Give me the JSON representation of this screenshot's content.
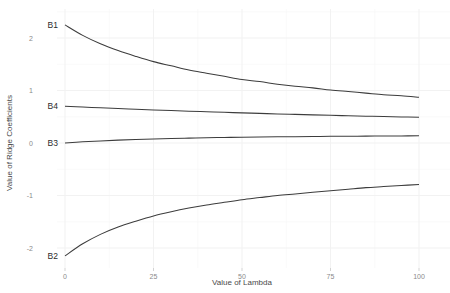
{
  "chart_data": {
    "type": "line",
    "title": "",
    "xlabel": "Value of Lambda",
    "ylabel": "Value of Ridge Coefficients",
    "xlim": [
      0,
      100
    ],
    "ylim": [
      -2.35,
      2.35
    ],
    "xticks": [
      0,
      25,
      50,
      75,
      100
    ],
    "xticklabels": [
      "0",
      "25",
      "50",
      "75",
      "100"
    ],
    "yticks": [
      2,
      1,
      0,
      -1,
      -2
    ],
    "yticklabels": [
      "2",
      "1",
      "0",
      "-1",
      "-2"
    ],
    "grid": true,
    "legend_position": "inline-left-labels",
    "line_color": "#3c3c3c",
    "panel_background": "#ffffff",
    "gridline_color": "#f2f2f2",
    "x": [
      0,
      5,
      10,
      15,
      20,
      25,
      30,
      35,
      40,
      45,
      50,
      55,
      60,
      65,
      70,
      75,
      80,
      85,
      90,
      95,
      100
    ],
    "series": [
      {
        "name": "B1",
        "label": "B1",
        "values": [
          2.25,
          2.05,
          1.89,
          1.76,
          1.65,
          1.55,
          1.47,
          1.39,
          1.33,
          1.27,
          1.21,
          1.17,
          1.12,
          1.08,
          1.05,
          1.01,
          0.98,
          0.95,
          0.92,
          0.9,
          0.87
        ]
      },
      {
        "name": "B4",
        "label": "B4",
        "values": [
          0.7,
          0.685,
          0.67,
          0.656,
          0.643,
          0.63,
          0.618,
          0.606,
          0.595,
          0.584,
          0.574,
          0.564,
          0.554,
          0.545,
          0.536,
          0.527,
          0.519,
          0.511,
          0.503,
          0.496,
          0.489
        ]
      },
      {
        "name": "B3",
        "label": "B3",
        "values": [
          0.0,
          0.022,
          0.04,
          0.055,
          0.067,
          0.077,
          0.086,
          0.093,
          0.1,
          0.105,
          0.11,
          0.114,
          0.118,
          0.121,
          0.124,
          0.127,
          0.129,
          0.131,
          0.133,
          0.135,
          0.137
        ]
      },
      {
        "name": "B2",
        "label": "B2",
        "values": [
          -2.15,
          -1.92,
          -1.74,
          -1.6,
          -1.49,
          -1.39,
          -1.31,
          -1.24,
          -1.18,
          -1.13,
          -1.08,
          -1.04,
          -1.0,
          -0.97,
          -0.94,
          -0.91,
          -0.88,
          -0.85,
          -0.83,
          -0.81,
          -0.79
        ]
      }
    ],
    "series_label_anchors": [
      {
        "name": "B1",
        "x": 0,
        "y": 2.25
      },
      {
        "name": "B4",
        "x": 0,
        "y": 0.7
      },
      {
        "name": "B3",
        "x": 0,
        "y": 0.0
      },
      {
        "name": "B2",
        "x": 0,
        "y": -2.15
      }
    ]
  }
}
